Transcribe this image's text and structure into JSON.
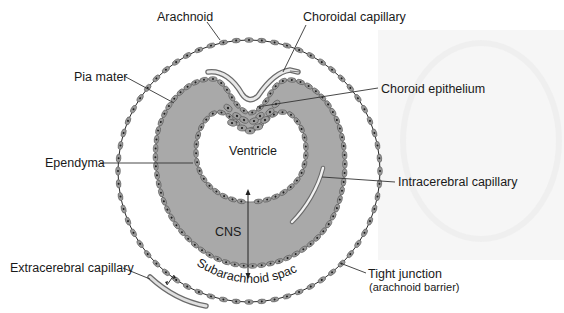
{
  "figure": {
    "colors": {
      "background": "#ffffff",
      "cns_tissue": "#a9a9a9",
      "cell": "#9a9a9a",
      "cell_nucleus": "#1f1f1f",
      "membrane_line": "#2a2a2a",
      "capillary_fill": "#e8e8e8",
      "capillary_wall": "#6b6b6b",
      "leader_line": "#333333"
    },
    "labels": {
      "arachnoid": "Arachnoid",
      "choroidal_capillary": "Choroidal capillary",
      "pia_mater": "Pia mater",
      "choroid_epithelium": "Choroid epithelium",
      "ventricle": "Ventricle",
      "ependyma": "Ependyma",
      "intracerebral_capillary": "Intracerebral capillary",
      "cns": "CNS",
      "extracerebral_capillary": "Extracerebral capillary",
      "subarachnoid_space": "Subarachnoid space",
      "tight_junction": "Tight junction",
      "tight_junction_sub": "(arachnoid barrier)"
    }
  }
}
